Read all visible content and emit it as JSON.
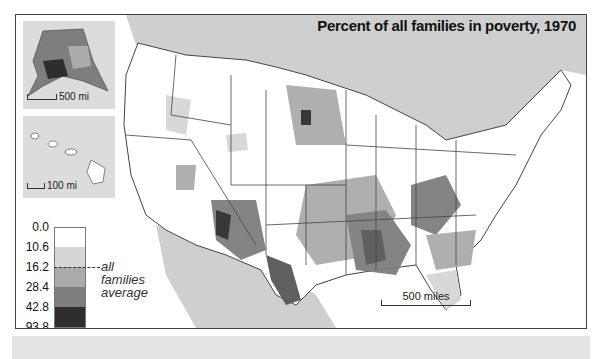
{
  "title": "Percent of all families in poverty, 1970",
  "insets": {
    "alaska": {
      "name": "Alaska",
      "scale_label": "500 mi"
    },
    "hawaii": {
      "name": "Hawaii",
      "scale_label": "100 mi"
    }
  },
  "main_scale_label": "500 miles",
  "legend": {
    "breaks": [
      "0.0",
      "10.6",
      "16.2",
      "28.4",
      "42.8",
      "93.8"
    ],
    "colors": [
      "#ffffff",
      "#d6d6d6",
      "#ababab",
      "#7e7e7e",
      "#585858",
      "#2e2e2e"
    ],
    "average_value": "16.2",
    "average_label_line1": "all families",
    "average_label_line2": "average"
  },
  "colors": {
    "land_background": "#ffffff",
    "neighbor_land": "#cfcfcf",
    "state_borders": "#444444",
    "frame": "#444444"
  }
}
